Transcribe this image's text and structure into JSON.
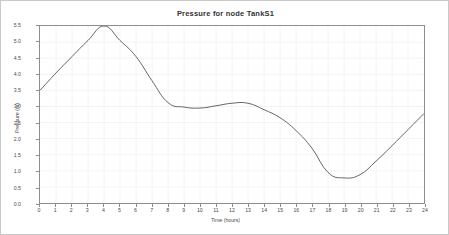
{
  "chart_data": {
    "type": "line",
    "title": "Pressure for node TankS1",
    "xlabel": "Time (hours)",
    "ylabel": "Pressure (m)",
    "xlim": [
      0,
      24
    ],
    "ylim": [
      0.0,
      5.5
    ],
    "grid": true,
    "legend": null,
    "line_color": "#555555",
    "x": [
      0,
      1,
      2,
      3,
      4,
      5,
      6,
      7,
      8,
      9,
      10,
      11,
      12,
      13,
      14,
      15,
      16,
      17,
      18,
      19,
      20,
      21,
      22,
      23,
      24
    ],
    "values": [
      3.5,
      4.04,
      4.55,
      5.05,
      5.5,
      5.05,
      4.55,
      3.8,
      3.12,
      2.98,
      2.95,
      3.02,
      3.1,
      3.1,
      2.9,
      2.65,
      2.25,
      1.7,
      0.95,
      0.78,
      0.88,
      1.3,
      1.78,
      2.28,
      2.78
    ],
    "xticks": [
      "0",
      "1",
      "2",
      "3",
      "4",
      "5",
      "6",
      "7",
      "8",
      "9",
      "10",
      "11",
      "12",
      "13",
      "14",
      "15",
      "16",
      "17",
      "18",
      "19",
      "20",
      "21",
      "22",
      "23",
      "24"
    ],
    "yticks": [
      "0.0",
      "0.5",
      "1.0",
      "1.5",
      "2.0",
      "2.5",
      "3.0",
      "3.5",
      "4.0",
      "4.5",
      "5.0",
      "5.5"
    ],
    "ytick_values": [
      0.0,
      0.5,
      1.0,
      1.5,
      2.0,
      2.5,
      3.0,
      3.5,
      4.0,
      4.5,
      5.0,
      5.5
    ]
  }
}
